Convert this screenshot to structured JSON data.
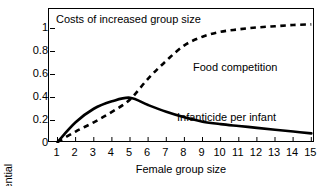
{
  "chart_data": {
    "type": "line",
    "title": "Costs of increased group size",
    "xlabel": "Female group size",
    "ylabel": "Lost reproductive potential",
    "xlim": [
      1,
      15
    ],
    "ylim": [
      0,
      1.08
    ],
    "xticks": [
      1,
      2,
      3,
      4,
      5,
      6,
      7,
      8,
      9,
      10,
      11,
      12,
      13,
      14,
      15
    ],
    "xticklabels": [
      "1",
      "2",
      "3",
      "4",
      "5",
      "6",
      "7",
      "8",
      "9",
      "10",
      "11",
      "12",
      "13",
      "14",
      "15"
    ],
    "yticks": [
      0,
      0.2,
      0.4,
      0.6,
      0.8,
      1
    ],
    "yticklabels": [
      "0",
      "0.2",
      "0.4",
      "0.6",
      "0.8",
      "1"
    ],
    "grid": false,
    "legend": "in-plot annotations",
    "x": [
      1,
      2,
      3,
      4,
      5,
      6,
      7,
      8,
      9,
      10,
      11,
      12,
      13,
      14,
      15
    ],
    "series": [
      {
        "name": "Infanticide per infant",
        "style": "solid",
        "color": "#000000",
        "values": [
          0.0,
          0.16,
          0.27,
          0.33,
          0.36,
          0.3,
          0.245,
          0.2,
          0.165,
          0.145,
          0.13,
          0.115,
          0.1,
          0.085,
          0.07
        ]
      },
      {
        "name": "Food competition",
        "style": "dashed",
        "color": "#000000",
        "values": [
          0.0,
          0.085,
          0.16,
          0.245,
          0.345,
          0.515,
          0.66,
          0.785,
          0.855,
          0.895,
          0.915,
          0.93,
          0.94,
          0.95,
          0.955
        ]
      }
    ],
    "annotations": [
      {
        "text": "Food competition",
        "x": 9.5,
        "y": 0.72
      },
      {
        "text": "Infanticide per infant",
        "x": 8.6,
        "y": 0.335
      }
    ]
  }
}
